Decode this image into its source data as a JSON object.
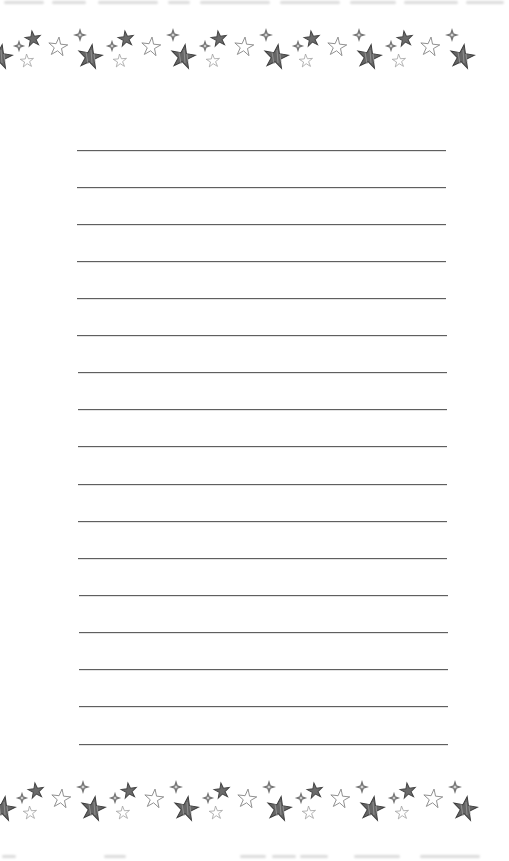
{
  "page": {
    "type": "printable lined writing paper",
    "background_color": "#ffffff"
  },
  "border": {
    "motif": "hand-drawn stars",
    "icons": [
      "dark-star-icon",
      "outline-star-icon",
      "small-outline-star-icon",
      "sparkle-icon",
      "big-dark-star-icon"
    ],
    "tile_width_px": 93,
    "star_fill_color": "#6a6a6a",
    "star_stroke_color": "#444444",
    "outline_star_color": "#8a8a8a",
    "top_center_y": 47,
    "bottom_center_y": 799
  },
  "ruled_lines": {
    "count": 17,
    "color": "#5f5f5f",
    "lines": [
      {
        "y": 150,
        "x1": 77,
        "x2": 446
      },
      {
        "y": 187,
        "x1": 77,
        "x2": 446
      },
      {
        "y": 224,
        "x1": 77,
        "x2": 446
      },
      {
        "y": 261,
        "x1": 77,
        "x2": 446
      },
      {
        "y": 298,
        "x1": 77,
        "x2": 446
      },
      {
        "y": 335,
        "x1": 77,
        "x2": 447
      },
      {
        "y": 372,
        "x1": 78,
        "x2": 447
      },
      {
        "y": 409,
        "x1": 78,
        "x2": 447
      },
      {
        "y": 446,
        "x1": 78,
        "x2": 447
      },
      {
        "y": 484,
        "x1": 78,
        "x2": 447
      },
      {
        "y": 521,
        "x1": 78,
        "x2": 447
      },
      {
        "y": 558,
        "x1": 78,
        "x2": 447
      },
      {
        "y": 595,
        "x1": 79,
        "x2": 448
      },
      {
        "y": 632,
        "x1": 79,
        "x2": 448
      },
      {
        "y": 669,
        "x1": 79,
        "x2": 448
      },
      {
        "y": 706,
        "x1": 79,
        "x2": 448
      },
      {
        "y": 744,
        "x1": 79,
        "x2": 448
      }
    ]
  }
}
